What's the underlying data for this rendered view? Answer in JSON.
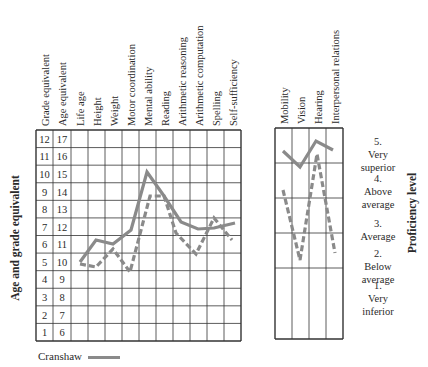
{
  "chart_data": [
    {
      "type": "line",
      "title": "",
      "ylabel": "Age and grade equivalent",
      "y_scales": {
        "grade_equivalent": [
          1,
          2,
          3,
          4,
          5,
          6,
          7,
          8,
          9,
          10,
          11,
          12
        ],
        "age_equivalent": [
          6,
          7,
          8,
          9,
          10,
          11,
          12,
          13,
          14,
          15,
          16,
          17
        ]
      },
      "ylim": [
        0,
        12
      ],
      "categories": [
        "Life age",
        "Height",
        "Weight",
        "Motor coordination",
        "Mental ability",
        "Reading",
        "Arithmetic reasoning",
        "Arithmetic computation",
        "Spelling",
        "Self-sufficiency"
      ],
      "series": [
        {
          "name": "Cranshaw",
          "style": "solid",
          "values_grade": [
            4.5,
            5.8,
            5.6,
            6.4,
            9.6,
            8.3,
            6.9,
            6.5,
            6.6,
            6.9
          ]
        },
        {
          "name": "Comparison (dashed)",
          "style": "dashed",
          "values_grade": [
            4.4,
            4.3,
            5.3,
            3.9,
            8.2,
            8.2,
            6.3,
            5.1,
            7.1,
            5.8
          ]
        }
      ],
      "grid": true
    },
    {
      "type": "line",
      "ylabel": "Proficiency level",
      "levels": [
        "1. Very inferior",
        "2. Below average",
        "3. Average",
        "4. Above average",
        "5. Very superior"
      ],
      "categories": [
        "Mobility",
        "Vision",
        "Hearing",
        "Interpersonal relations"
      ],
      "series": [
        {
          "name": "Cranshaw",
          "style": "solid",
          "values": [
            4.7,
            4.3,
            5.0,
            4.7
          ]
        },
        {
          "name": "Comparison (dashed)",
          "style": "dashed",
          "values": [
            3.6,
            1.8,
            4.5,
            1.9
          ]
        }
      ],
      "grid": true
    }
  ],
  "left_chart": {
    "headers": [
      "Grade equivalent",
      "Age equivalent",
      "Life age",
      "Height",
      "Weight",
      "Motor coordination",
      "Mental ability",
      "Reading",
      "Arithmetic reasoning",
      "Arithmetic computation",
      "Spelling",
      "Self-sufficiency"
    ],
    "grade_labels": [
      "12",
      "11",
      "10",
      "9",
      "8",
      "7",
      "6",
      "5",
      "4",
      "3",
      "2",
      "1"
    ],
    "age_labels": [
      "17",
      "16",
      "15",
      "14",
      "13",
      "12",
      "11",
      "10",
      "9",
      "8",
      "7",
      "6"
    ],
    "axis_title": "Age and grade equivalent",
    "solid_points": "80,262 96,240 113,244 131,230 147,172 164,196 181,222 198,229 214,228 235,223",
    "dashed_points": "80,264 96,267 113,249 130,272 150,196 164,196 176,233 196,254 214,218 232,240"
  },
  "right_chart": {
    "headers": [
      "Mobility",
      "Vision",
      "Hearing",
      "Interpersonal relations"
    ],
    "axis_title": "Proficiency level",
    "levels": [
      {
        "num": "5.",
        "lines": [
          "Very",
          "superior"
        ]
      },
      {
        "num": "4.",
        "lines": [
          "Above",
          "average"
        ]
      },
      {
        "num": "3.",
        "lines": [
          "Average"
        ]
      },
      {
        "num": "2.",
        "lines": [
          "Below",
          "average"
        ]
      },
      {
        "num": "1.",
        "lines": [
          "Very",
          "inferior"
        ]
      }
    ],
    "solid_points": "283,151 300,167 316,141 333,150",
    "dashed_points": "283,190 300,260 317,154 335,253"
  },
  "legend": {
    "label": "Cranshaw"
  },
  "colors": {
    "line": "#8a8a8a",
    "grid": "#333333"
  }
}
